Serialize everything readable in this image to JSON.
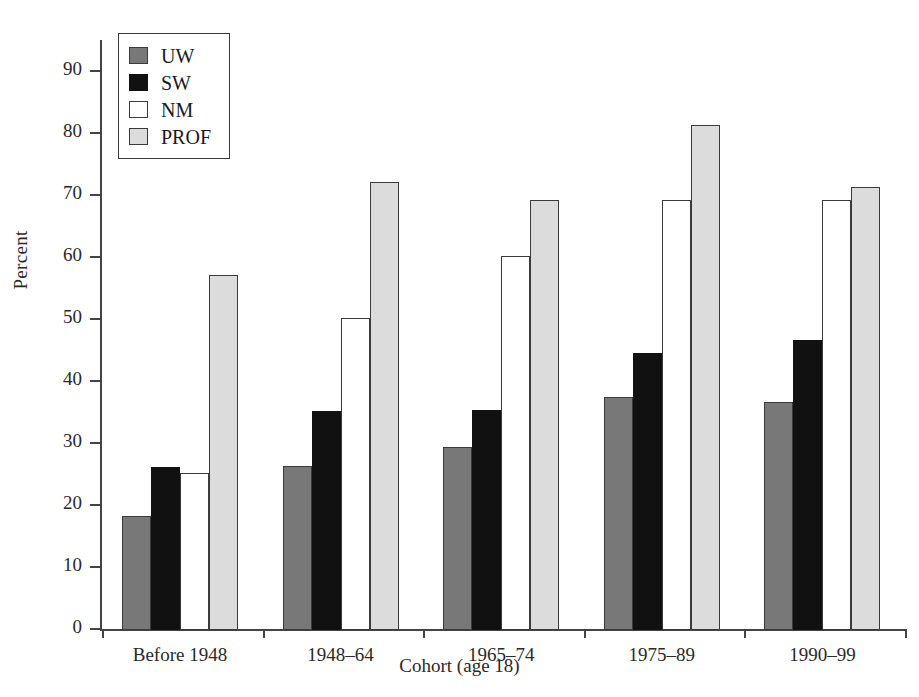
{
  "chart_data": {
    "type": "bar",
    "title": "",
    "xlabel": "Cohort (age 18)",
    "ylabel": "Percent",
    "ylim": [
      0,
      95
    ],
    "ytick_values": [
      0,
      10,
      20,
      30,
      40,
      50,
      60,
      70,
      80,
      90
    ],
    "ytick_labels": [
      "0",
      "10",
      "20",
      "30",
      "40",
      "50",
      "60",
      "70",
      "80",
      "90"
    ],
    "grid": false,
    "legend_position": "upper-left-inside",
    "categories": [
      "Before 1948",
      "1948–64",
      "1965–74",
      "1975–89",
      "1990–99"
    ],
    "series": [
      {
        "name": "UW",
        "color": "#787878",
        "values": [
          18.4,
          26.5,
          29.5,
          37.6,
          36.7
        ]
      },
      {
        "name": "SW",
        "color": "#111111",
        "values": [
          26.3,
          35.4,
          35.5,
          44.7,
          46.7
        ]
      },
      {
        "name": "NM",
        "color": "#ffffff",
        "values": [
          25.4,
          50.4,
          60.3,
          69.4,
          69.4
        ]
      },
      {
        "name": "PROF",
        "color": "#dcdcdc",
        "values": [
          57.2,
          72.2,
          69.3,
          81.4,
          71.5
        ]
      }
    ]
  },
  "legend": {
    "items": [
      {
        "label": "UW"
      },
      {
        "label": "SW"
      },
      {
        "label": "NM"
      },
      {
        "label": "PROF"
      }
    ]
  }
}
